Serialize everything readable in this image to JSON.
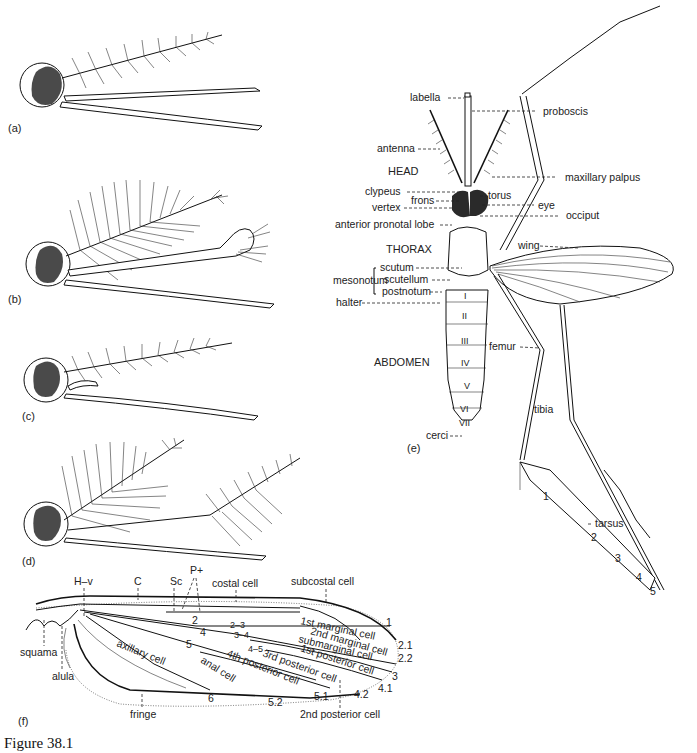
{
  "figure": {
    "caption": "Figure 38.1",
    "panels": {
      "a": "(a)",
      "b": "(b)",
      "c": "(c)",
      "d": "(d)",
      "e": "(e)",
      "f": "(f)"
    }
  },
  "panel_e": {
    "regions": {
      "head": "HEAD",
      "thorax": "THORAX",
      "abdomen": "ABDOMEN"
    },
    "labels_left": {
      "labella": "labella",
      "antenna": "antenna",
      "clypeus": "clypeus",
      "frons": "frons",
      "vertex": "vertex",
      "anterior_pronotal_lobe": "anterior pronotal lobe",
      "mesonotum": "mesonotum",
      "scutum": "scutum",
      "scutellum": "scutellum",
      "postnotum": "postnotum",
      "halter": "halter",
      "cerci": "cerci"
    },
    "labels_right": {
      "proboscis": "proboscis",
      "maxillary_palpus": "maxillary palpus",
      "torus": "torus",
      "eye": "eye",
      "occiput": "occiput",
      "wing": "wing",
      "femur": "femur",
      "tibia": "tibia",
      "tarsus": "tarsus"
    },
    "abdominal_segments": [
      "I",
      "II",
      "III",
      "IV",
      "V",
      "VI",
      "VII"
    ],
    "tarsal_segments": [
      "1",
      "2",
      "3",
      "4",
      "5"
    ]
  },
  "panel_f": {
    "top_labels": {
      "hv": "H–v",
      "c": "C",
      "sc": "Sc",
      "p_plus": "P+",
      "costal_cell": "costal cell",
      "subcostal_cell": "subcostal cell"
    },
    "left_labels": {
      "squama": "squama",
      "alula": "alula"
    },
    "bottom_labels": {
      "fringe": "fringe",
      "second_posterior_cell": "2nd posterior cell"
    },
    "cells": {
      "first_marginal": "1st marginal cell",
      "second_marginal": "2nd marginal cell",
      "submarginal": "submarginal cell",
      "first_posterior": "1st posterior cell",
      "third_posterior": "3rd posterior cell",
      "fourth_posterior": "4th posterior cell",
      "anal": "anal cell",
      "axillary": "axillary cell"
    },
    "veins": {
      "v2": "2",
      "v4": "4",
      "v5": "5",
      "v6": "6",
      "v2_3": "2–3",
      "v3_4": "3–4",
      "v4_5": "4–5",
      "v1": "1",
      "v2_1": "2.1",
      "v2_2": "2.2",
      "v3": "3",
      "v4_1": "4.1",
      "v4_2": "4.2",
      "v5_1": "5.1",
      "v5_2": "5.2"
    }
  }
}
